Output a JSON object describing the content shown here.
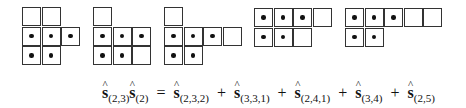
{
  "diagrams": [
    {
      "name": "diagram-1",
      "left": 22,
      "top": 7,
      "rows": [
        [
          0,
          0
        ],
        [
          1,
          1,
          1
        ],
        [
          1,
          1
        ]
      ]
    },
    {
      "name": "diagram-2",
      "left": 93,
      "top": 7,
      "rows": [
        [
          0
        ],
        [
          1,
          1,
          1
        ],
        [
          1,
          1,
          0
        ]
      ]
    },
    {
      "name": "diagram-3",
      "left": 164,
      "top": 7,
      "rows": [
        [
          0
        ],
        [
          1,
          1,
          1,
          0
        ],
        [
          1,
          1
        ]
      ]
    },
    {
      "name": "diagram-4",
      "left": 254,
      "top": 8,
      "rows": [
        [
          1,
          1,
          1,
          0
        ],
        [
          1,
          1,
          0
        ]
      ]
    },
    {
      "name": "diagram-5",
      "left": 345,
      "top": 8,
      "rows": [
        [
          1,
          1,
          1,
          0,
          0
        ],
        [
          1,
          1
        ]
      ]
    }
  ],
  "formula": {
    "symbol": "s",
    "hat": "^",
    "lhs": [
      {
        "sub": "(2,3)"
      },
      {
        "sub": "(2)"
      }
    ],
    "equals": "=",
    "plus": "+",
    "rhs": [
      {
        "sub": "(2,3,2)"
      },
      {
        "sub": "(3,3,1)"
      },
      {
        "sub": "(2,4,1)"
      },
      {
        "sub": "(3,4)"
      },
      {
        "sub": "(2,5)"
      }
    ]
  }
}
